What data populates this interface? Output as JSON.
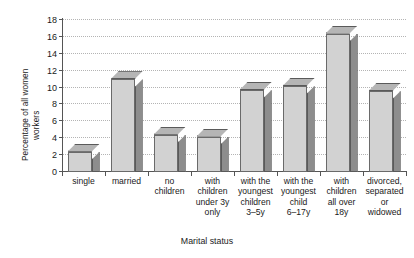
{
  "chart_data": {
    "type": "bar",
    "title": "",
    "xlabel": "Marital status",
    "ylabel": "Percentage of all women workers",
    "ylabel_lines": [
      "Percentage of all women",
      "workers"
    ],
    "categories": [
      "single",
      "married",
      "no children",
      "with children under 3y only",
      "with the youngest children 3–5y",
      "with the youngest child 6–17y",
      "with children all over 18y",
      "divorced, separated or widowed"
    ],
    "category_lines": [
      [
        "single"
      ],
      [
        "married"
      ],
      [
        "no",
        "children"
      ],
      [
        "with",
        "children",
        "under 3y",
        "only"
      ],
      [
        "with the",
        "youngest",
        "children",
        "3–5y"
      ],
      [
        "with the",
        "youngest",
        "child",
        "6–17y"
      ],
      [
        "with",
        "children",
        "all over",
        "18y"
      ],
      [
        "divorced,",
        "separated",
        "or",
        "widowed"
      ]
    ],
    "values": [
      2.4,
      11.0,
      4.4,
      4.2,
      9.7,
      10.2,
      16.4,
      9.6
    ],
    "ylim": [
      0,
      18
    ],
    "ytick_step": 2,
    "yticks": [
      0,
      2,
      4,
      6,
      8,
      10,
      12,
      14,
      16,
      18
    ],
    "ytick_labels": [
      "0",
      "2",
      "4",
      "6",
      "8",
      "10",
      "12",
      "14",
      "16",
      "18"
    ],
    "grid": true,
    "grid_style": "dotted-horizontal",
    "legend": false,
    "style": "3d-bars",
    "colors": {
      "bar_front": "#d2d2d2",
      "bar_side": "#8d8d8d",
      "bar_top": "#b5b5b5",
      "bar_edge": "#6a6a6a",
      "gridline": "#b4b4b4",
      "axis": "#555555",
      "background": "#ffffff",
      "text": "#1a1a1a"
    }
  }
}
